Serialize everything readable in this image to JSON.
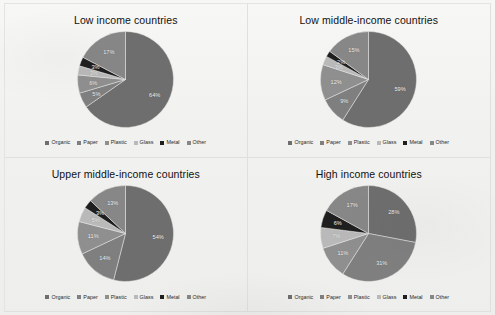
{
  "figure": {
    "categories": [
      "Organic",
      "Paper",
      "Plastic",
      "Glass",
      "Metal",
      "Other"
    ],
    "colors": {
      "Organic": "#6e6e6e",
      "Paper": "#7f7f7f",
      "Plastic": "#8f8f8f",
      "Glass": "#b9b9b9",
      "Metal": "#1f1f1f",
      "Other": "#878787"
    }
  },
  "chart_data": [
    {
      "type": "pie",
      "title": "Low income countries",
      "categories": [
        "Organic",
        "Paper",
        "Plastic",
        "Glass",
        "Metal",
        "Other"
      ],
      "values": [
        64,
        5,
        6,
        3,
        3,
        17
      ],
      "labels": [
        "64%",
        "5%",
        "6%",
        "3%",
        "3%",
        "17%"
      ],
      "legend_position": "bottom",
      "legend": [
        "Organic",
        "Paper",
        "Plastic",
        "Glass",
        "Metal",
        "Other"
      ]
    },
    {
      "type": "pie",
      "title": "Low middle-income countries",
      "categories": [
        "Organic",
        "Paper",
        "Plastic",
        "Glass",
        "Metal",
        "Other"
      ],
      "values": [
        59,
        9,
        12,
        3,
        2,
        15
      ],
      "labels": [
        "59%",
        "9%",
        "12%",
        "3%",
        "2%",
        "15%"
      ],
      "legend_position": "bottom",
      "legend": [
        "Organic",
        "Paper",
        "Plastic",
        "Glass",
        "Metal",
        "Other"
      ]
    },
    {
      "type": "pie",
      "title": "Upper middle-income countries",
      "categories": [
        "Organic",
        "Paper",
        "Plastic",
        "Glass",
        "Metal",
        "Other"
      ],
      "values": [
        54,
        14,
        11,
        5,
        3,
        13
      ],
      "labels": [
        "54%",
        "14%",
        "11%",
        "5%",
        "3%",
        "13%"
      ],
      "legend_position": "bottom",
      "legend": [
        "Organic",
        "Paper",
        "Plastic",
        "Glass",
        "Metal",
        "Other"
      ]
    },
    {
      "type": "pie",
      "title": "High income countries",
      "categories": [
        "Organic",
        "Paper",
        "Plastic",
        "Glass",
        "Metal",
        "Other"
      ],
      "values": [
        28,
        31,
        11,
        7,
        6,
        17
      ],
      "labels": [
        "28%",
        "31%",
        "11%",
        "7%",
        "6%",
        "17%"
      ],
      "legend_position": "bottom",
      "legend": [
        "Organic",
        "Paper",
        "Plastic",
        "Glass",
        "Metal",
        "Other"
      ]
    }
  ]
}
